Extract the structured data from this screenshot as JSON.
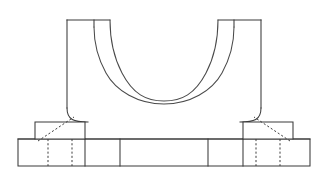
{
  "drawing": {
    "title": "Bearing Bracket Front View",
    "subject": "bearing-bracket",
    "view": "front elevation",
    "background_color": "#ffffff",
    "line_color": "#3a3a3a",
    "hidden_line_color": "#3f3f3f",
    "arc_line_color": "#4a4a4a",
    "line_weight_px": 1.05,
    "hidden_line_dash": "2.1 2.1",
    "canvas": {
      "width": 332,
      "height": 173
    }
  },
  "geometry": {
    "base_plate": {
      "name": "base-plate",
      "left": 18,
      "right": 310,
      "top": 139,
      "bottom": 166,
      "height": 27,
      "width": 292
    },
    "base_divisions": [
      {
        "name": "base-division-left-inner",
        "x": 85
      },
      {
        "name": "base-division-left-outer",
        "x": 120
      },
      {
        "name": "base-division-right-outer",
        "x": 208
      },
      {
        "name": "base-division-right-inner",
        "x": 243
      }
    ],
    "boss_left": {
      "name": "boss-pad-left",
      "left": 35,
      "right": 85,
      "top": 122,
      "bottom": 139
    },
    "boss_right": {
      "name": "boss-pad-right",
      "left": 243,
      "right": 293,
      "top": 122,
      "bottom": 139
    },
    "hidden_lines_left": [
      {
        "name": "hidden-bore-edge-left-a",
        "x": 48,
        "y_top": 139,
        "y_bottom": 166
      },
      {
        "name": "hidden-bore-edge-left-b",
        "x": 72,
        "y_top": 139,
        "y_bottom": 166
      }
    ],
    "hidden_lines_right": [
      {
        "name": "hidden-bore-edge-right-a",
        "x": 256,
        "y_top": 139,
        "y_bottom": 166
      },
      {
        "name": "hidden-bore-edge-right-b",
        "x": 280,
        "y_top": 139,
        "y_bottom": 166
      }
    ],
    "hidden_diagonal_left": {
      "name": "hidden-fillet-diagonal-left",
      "x1": 38,
      "y1": 141,
      "x2": 74,
      "y2": 117
    },
    "hidden_diagonal_right": {
      "name": "hidden-fillet-diagonal-right",
      "x1": 290,
      "y1": 141,
      "x2": 254,
      "y2": 117
    },
    "upright_left": {
      "name": "upright-wall-left",
      "top_y": 20,
      "top_left_x": 67,
      "top_right_x": 110,
      "outer_wall_x": 67,
      "wall_base_y": 108,
      "fillet_end_x": 88,
      "fillet_end_y": 128
    },
    "upright_right": {
      "name": "upright-wall-right",
      "top_y": 20,
      "top_left_x": 218,
      "top_right_x": 261,
      "outer_wall_x": 261,
      "wall_base_y": 108,
      "fillet_end_x": 240,
      "fillet_end_y": 128
    },
    "bore": {
      "name": "bore-semicircle",
      "center_x": 164,
      "center_y": 77,
      "inner_radius": 53,
      "outer_radius": 70,
      "inner_start_x": 94,
      "outer_start_x": 110,
      "opening_top_y": 20,
      "description": "two concentric semicircular arcs forming bore and counterbore rim"
    },
    "top_seam_left": {
      "name": "top-seam-left",
      "x": 94,
      "y_top": 20,
      "y_bottom": 24
    },
    "top_seam_right": {
      "name": "top-seam-right",
      "x": 234,
      "y_top": 20,
      "y_bottom": 24
    }
  },
  "features": [
    {
      "name": "upright-wall-left",
      "label": "Left upright wall"
    },
    {
      "name": "upright-wall-right",
      "label": "Right upright wall"
    },
    {
      "name": "bore-semicircle",
      "label": "Semicircular bore"
    },
    {
      "name": "counterbore-rim",
      "label": "Counterbore rim arc"
    },
    {
      "name": "base-plate",
      "label": "Base plate"
    },
    {
      "name": "boss-pad-left",
      "label": "Left boss pad"
    },
    {
      "name": "boss-pad-right",
      "label": "Right boss pad"
    },
    {
      "name": "fillet-left",
      "label": "Left fillet transition"
    },
    {
      "name": "fillet-right",
      "label": "Right fillet transition"
    }
  ]
}
